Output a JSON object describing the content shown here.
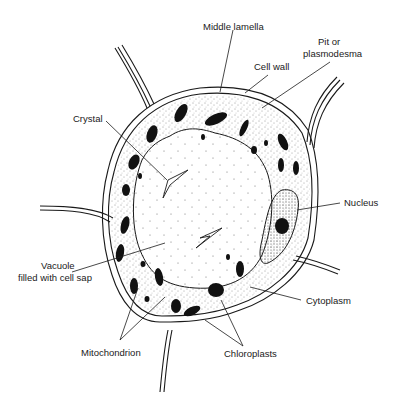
{
  "diagram": {
    "labels": {
      "middle_lamella": "Middle lamella",
      "pit_line1": "Pit or",
      "pit_line2": "plasmodesma",
      "cell_wall": "Cell wall",
      "crystal": "Crystal",
      "nucleus": "Nucleus",
      "vacuole_line1": "Vacuole",
      "vacuole_line2": "filled with cell sap",
      "cytoplasm": "Cytoplasm",
      "mitochondrion": "Mitochondrion",
      "chloroplasts": "Chloroplasts"
    },
    "colors": {
      "ink": "#1a1a1a",
      "background": "#ffffff"
    }
  }
}
